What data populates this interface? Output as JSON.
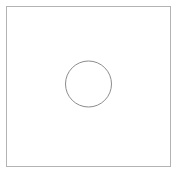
{
  "canvas": {
    "name": "shape-diagram-canvas",
    "width": 177,
    "height": 172,
    "background_color": "#ffffff",
    "title": ""
  },
  "shapes": [
    {
      "name": "outer-square",
      "type": "rectangle",
      "label": "",
      "x": 6,
      "y": 6,
      "width": 164,
      "height": 160,
      "stroke_color": "#b3b3b3",
      "stroke_width": 1,
      "fill_color": "none"
    },
    {
      "name": "inner-circle",
      "type": "circle",
      "label": "",
      "cx": 88.5,
      "cy": 84,
      "r": 23,
      "stroke_color": "#8c8c8c",
      "stroke_width": 1,
      "fill_color": "none"
    }
  ],
  "annotations": {
    "labels": [],
    "caption": ""
  }
}
